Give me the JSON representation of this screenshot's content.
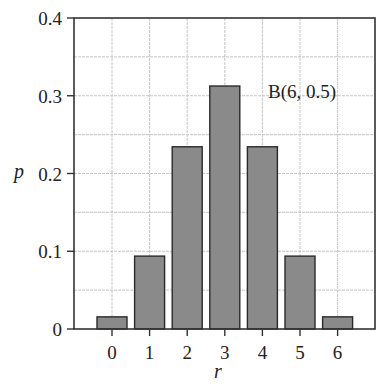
{
  "chart_data": {
    "type": "bar",
    "title": "",
    "annotation": "B(6, 0.5)",
    "xlabel": "r",
    "ylabel": "p",
    "categories": [
      "0",
      "1",
      "2",
      "3",
      "4",
      "5",
      "6"
    ],
    "values": [
      0.015625,
      0.09375,
      0.234375,
      0.3125,
      0.234375,
      0.09375,
      0.015625
    ],
    "ylim": [
      0,
      0.4
    ],
    "yticks": [
      "0",
      "0.1",
      "0.2",
      "0.3",
      "0.4"
    ],
    "ytick_values": [
      0,
      0.1,
      0.2,
      0.3,
      0.4
    ],
    "grid": true,
    "legend": null,
    "bar_color": "#8a8a8a",
    "bar_edge_color": "#2a2a2a",
    "grid_color": "#c4c4c4"
  }
}
